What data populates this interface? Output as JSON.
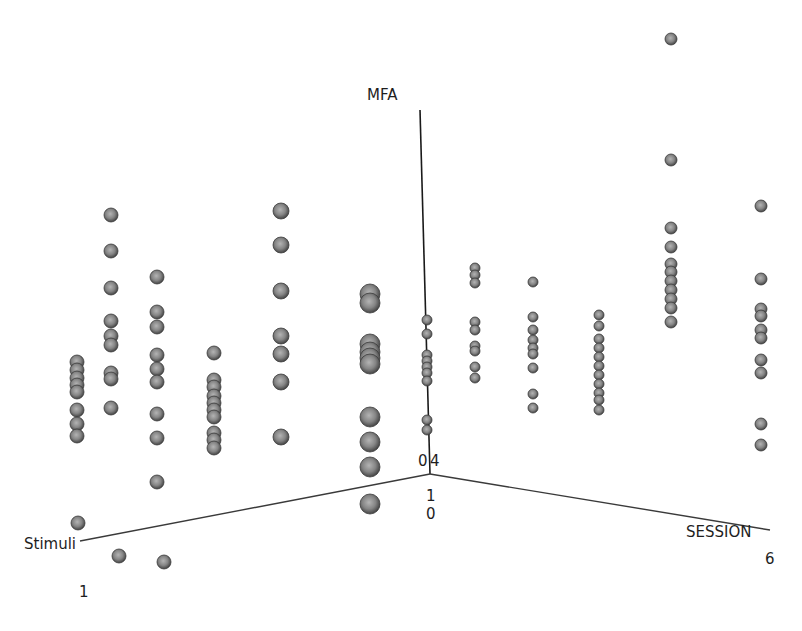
{
  "chart_data": {
    "type": "scatter3d",
    "title": "",
    "axes": {
      "x": {
        "label": "Stimuli",
        "tick_labels": [
          "1"
        ]
      },
      "y": {
        "label": "SESSION",
        "tick_labels": [
          "0",
          "6"
        ]
      },
      "z": {
        "label": "MFA",
        "tick_labels": [
          "0",
          "4",
          "1"
        ]
      }
    },
    "origin_ticks": {
      "z_zero": "0",
      "z_top": "4",
      "x_one": "1",
      "y_zero": "0"
    },
    "marker": {
      "shape": "sphere",
      "color": "#7a7a7a",
      "edge": "#3c3c3c"
    },
    "grid": false,
    "legend": null,
    "columns": [
      {
        "id": "c1",
        "screen_x": 77,
        "points_y": [
          362,
          370,
          378,
          385,
          392,
          410,
          424,
          436
        ],
        "r": 7
      },
      {
        "id": "c2",
        "screen_x": 111,
        "points_y": [
          215,
          251,
          288,
          321,
          336,
          345,
          373,
          379,
          408
        ],
        "r": 7
      },
      {
        "id": "c3",
        "screen_x": 157,
        "points_y": [
          277,
          312,
          327,
          355,
          369,
          382,
          414,
          438,
          482
        ],
        "r": 7
      },
      {
        "id": "c4",
        "screen_x": 214,
        "points_y": [
          353,
          380,
          387,
          396,
          403,
          410,
          417,
          433,
          440,
          448
        ],
        "r": 7
      },
      {
        "id": "c5",
        "screen_x": 281,
        "points_y": [
          211,
          245,
          291,
          336,
          354,
          382,
          437
        ],
        "r": 8
      },
      {
        "id": "c6",
        "screen_x": 370,
        "points_y": [
          294,
          303,
          344,
          352,
          358,
          364,
          417,
          442,
          467,
          504
        ],
        "r": 10
      },
      {
        "id": "c7",
        "screen_x": 427,
        "points_y": [
          320,
          334,
          355,
          361,
          367,
          373,
          381,
          420,
          430
        ],
        "r": 5
      },
      {
        "id": "c8",
        "screen_x": 475,
        "points_y": [
          268,
          275,
          283,
          322,
          330,
          346,
          351,
          367,
          378
        ],
        "r": 5
      },
      {
        "id": "c9",
        "screen_x": 533,
        "points_y": [
          282,
          317,
          330,
          340,
          348,
          354,
          368,
          394,
          408
        ],
        "r": 5
      },
      {
        "id": "c10",
        "screen_x": 599,
        "points_y": [
          315,
          326,
          339,
          348,
          357,
          366,
          375,
          384,
          393,
          400,
          410
        ],
        "r": 5
      },
      {
        "id": "c11",
        "screen_x": 671,
        "points_y": [
          39,
          160,
          228,
          247,
          264,
          272,
          281,
          290,
          299,
          308,
          322
        ],
        "r": 6
      },
      {
        "id": "c12",
        "screen_x": 761,
        "points_y": [
          206,
          279,
          309,
          316,
          330,
          338,
          360,
          373,
          424,
          445
        ],
        "r": 6
      },
      {
        "id": "c13",
        "screen_x": 78,
        "points_y": [
          523
        ],
        "r": 7
      },
      {
        "id": "c14",
        "screen_x": 119,
        "points_y": [
          556
        ],
        "r": 7
      },
      {
        "id": "c15",
        "screen_x": 164,
        "points_y": [
          562
        ],
        "r": 7
      }
    ]
  },
  "labels": {
    "mfa": "MFA",
    "stimuli": "Stimuli",
    "session": "SESSION",
    "tick_origin_left": "0",
    "tick_origin_right": "4",
    "tick_below_1": "1",
    "tick_below_2": "0",
    "tick_stimuli_end": "1",
    "tick_session_end": "6"
  }
}
